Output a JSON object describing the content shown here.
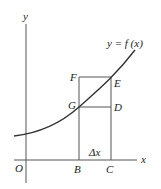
{
  "diagram": {
    "curve_label": "y = f (x)",
    "axes": {
      "x_label": "x",
      "y_label": "y",
      "origin_label": "O"
    },
    "points": {
      "B": "B",
      "C": "C",
      "D": "D",
      "E": "E",
      "F": "F",
      "G": "G"
    },
    "delta_label": "Δx",
    "colors": {
      "line": "#555555",
      "curve": "#333333",
      "text": "#222222"
    }
  }
}
